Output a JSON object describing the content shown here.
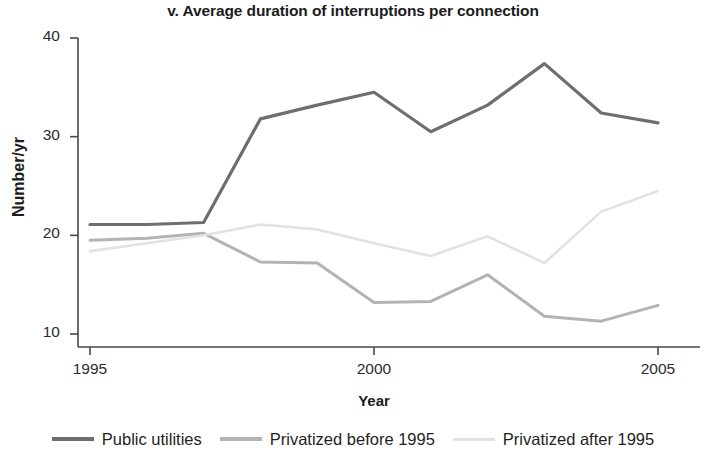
{
  "chart_data": {
    "type": "line",
    "title": "v. Average duration of interruptions per connection",
    "xlabel": "Year",
    "ylabel": "Number/yr",
    "x": [
      1995,
      1996,
      1997,
      1998,
      1999,
      2000,
      2001,
      2002,
      2003,
      2004,
      2005
    ],
    "xlim": [
      1995,
      2005
    ],
    "ylim": [
      8.5,
      41
    ],
    "xticks": [
      1995,
      2000,
      2005
    ],
    "xtick_labels": [
      "1995",
      "2000",
      "2005"
    ],
    "yticks": [
      10,
      20,
      30,
      40
    ],
    "ytick_labels": [
      "10",
      "20",
      "30",
      "40"
    ],
    "grid": false,
    "legend_position": "bottom",
    "series": [
      {
        "name": "Public utilities",
        "color": "#6e6e6e",
        "width": 3.2,
        "values": [
          21.1,
          21.1,
          21.3,
          31.8,
          33.2,
          34.5,
          30.5,
          33.2,
          37.4,
          32.4,
          31.4
        ]
      },
      {
        "name": "Privatized before 1995",
        "color": "#b3b3b3",
        "width": 3.0,
        "values": [
          19.5,
          19.7,
          20.2,
          17.3,
          17.2,
          13.2,
          13.3,
          16.0,
          11.8,
          11.3,
          12.9
        ]
      },
      {
        "name": "Privatized after 1995",
        "color": "#e2e2e2",
        "width": 2.6,
        "values": [
          18.4,
          19.2,
          20.0,
          21.1,
          20.6,
          19.2,
          17.9,
          19.9,
          17.2,
          22.4,
          24.5
        ]
      }
    ]
  },
  "legend": {
    "items": [
      {
        "label": "Public utilities",
        "color": "#6e6e6e"
      },
      {
        "label": "Privatized before 1995",
        "color": "#b3b3b3"
      },
      {
        "label": "Privatized after 1995",
        "color": "#e2e2e2"
      }
    ]
  },
  "axes": {
    "axis_color": "#4a4a4a"
  }
}
